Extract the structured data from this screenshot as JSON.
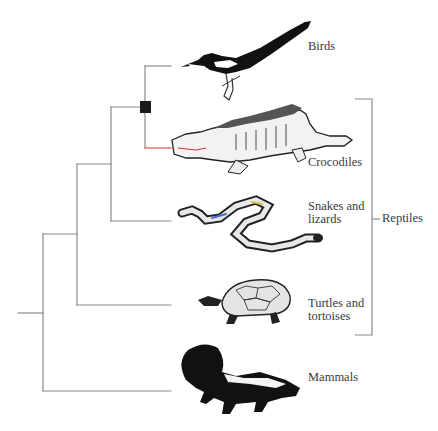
{
  "diagram": {
    "type": "phylogenetic-tree",
    "taxa": [
      {
        "id": "birds",
        "label_lines": [
          "Birds"
        ],
        "icon": "magpie-illustration"
      },
      {
        "id": "crocodiles",
        "label_lines": [
          "Crocodiles"
        ],
        "icon": "crocodile-illustration"
      },
      {
        "id": "snakes-lizards",
        "label_lines": [
          "Snakes and",
          "lizards"
        ],
        "icon": "snake-illustration"
      },
      {
        "id": "turtles",
        "label_lines": [
          "Turtles and",
          "tortoises"
        ],
        "icon": "turtle-illustration"
      },
      {
        "id": "mammals",
        "label_lines": [
          "Mammals"
        ],
        "icon": "skunk-illustration"
      }
    ],
    "topology": "(Mammals,(Turtles and tortoises,(Snakes and lizards,(Birds,Crocodiles))))",
    "marked_node": {
      "clade": [
        "Birds",
        "Crocodiles"
      ],
      "marker": "black-square"
    },
    "bracket": {
      "label": "Reptiles",
      "spans": [
        "Crocodiles",
        "Snakes and lizards",
        "Turtles and tortoises"
      ]
    },
    "colors": {
      "branch": "#8a8a8a",
      "crocodile_branch": "#d9534f",
      "node_marker": "#1a1a1a",
      "text": "#3a3a3a"
    }
  }
}
